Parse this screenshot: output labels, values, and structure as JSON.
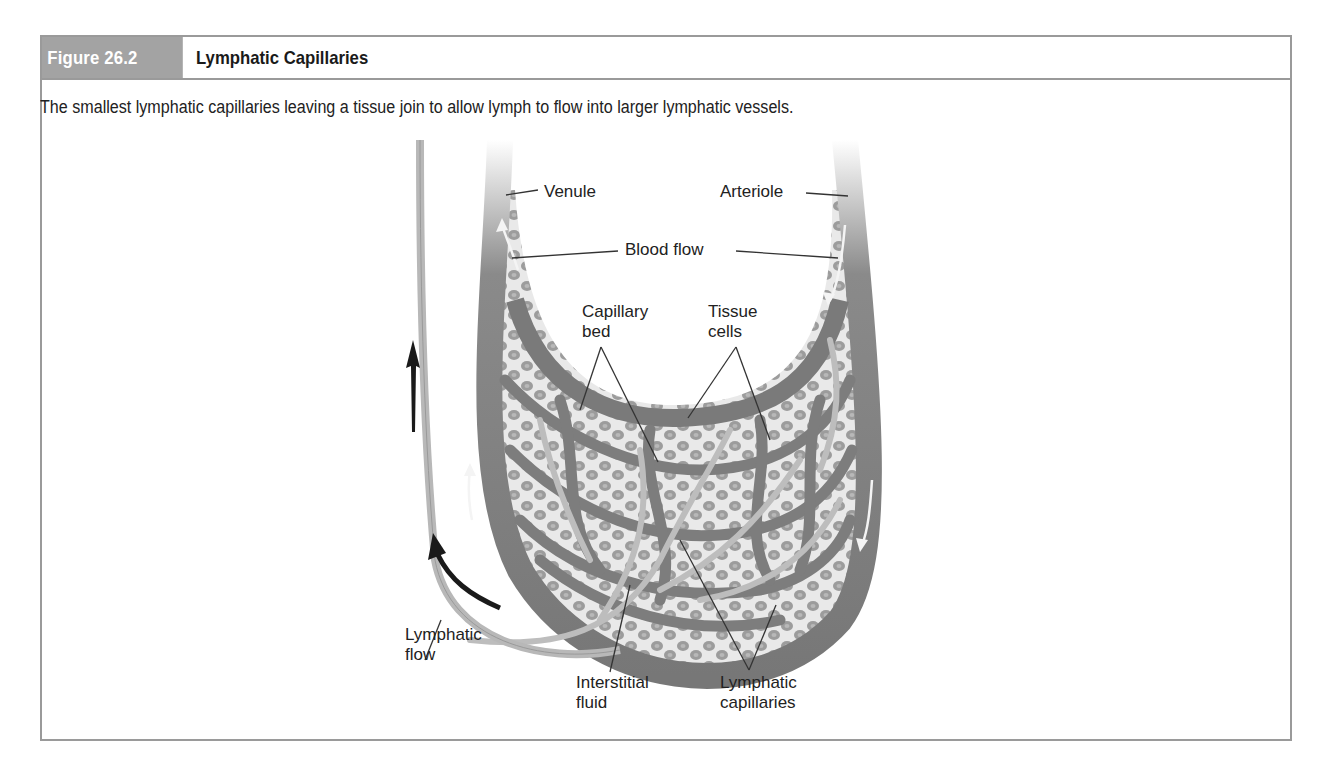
{
  "figure": {
    "number": "Figure 26.2",
    "title": "Lymphatic Capillaries",
    "caption": "The smallest lymphatic capillaries leaving a tissue join to allow lymph to flow into larger lymphatic vessels."
  },
  "labels": {
    "venule": "Venule",
    "arteriole": "Arteriole",
    "blood_flow": "Blood flow",
    "capillary_bed_1": "Capillary",
    "capillary_bed_2": "bed",
    "tissue_cells_1": "Tissue",
    "tissue_cells_2": "cells",
    "lymphatic_flow_1": "Lymphatic",
    "lymphatic_flow_2": "flow",
    "interstitial_fluid_1": "Interstitial",
    "interstitial_fluid_2": "fluid",
    "lymphatic_capillaries_1": "Lymphatic",
    "lymphatic_capillaries_2": "capillaries"
  },
  "colors": {
    "frame_border": "#9a9a9a",
    "figure_number_bg": "#a3a3a3",
    "vessel": "#7a7a7a",
    "lymph_vessel": "#bdbdbd",
    "cell": "#9b9b9b",
    "arrow": "#1a1a1a"
  }
}
